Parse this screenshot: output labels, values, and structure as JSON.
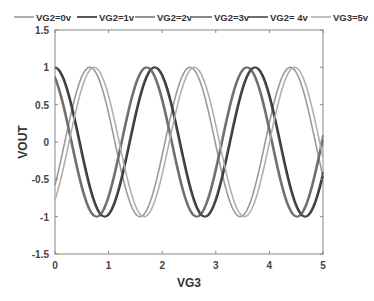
{
  "chart_data": {
    "type": "line",
    "title": "",
    "xlabel": "VG3",
    "ylabel": "VOUT",
    "xlim": [
      0,
      5
    ],
    "ylim": [
      -1.5,
      1.5
    ],
    "xticks": [
      0,
      1,
      2,
      3,
      4,
      5
    ],
    "xtick_labels": [
      "0",
      "1",
      "2",
      "3",
      "4",
      "5"
    ],
    "yticks": [
      -1.5,
      -1,
      -0.5,
      0,
      0.5,
      1,
      1.5
    ],
    "ytick_labels": [
      "-1.5",
      "-1",
      "-0.5",
      "0",
      "0.5",
      "1",
      "1.5"
    ],
    "grid": false,
    "legend_position": "top",
    "x": [
      0,
      0.25,
      0.5,
      0.75,
      1,
      1.25,
      1.5,
      1.75,
      2,
      2.25,
      2.5,
      2.75,
      3,
      3.25,
      3.5,
      3.75,
      4,
      4.25,
      4.5,
      4.75,
      5
    ],
    "series": [
      {
        "name": "VG2=0v",
        "color": "#9a9a9a",
        "period": 1.87,
        "phase": 0.65,
        "values": [
          0.45,
          0.83,
          1.0,
          0.9,
          0.57,
          0.1,
          -0.39,
          -0.79,
          -0.99,
          -0.94,
          -0.64,
          -0.2,
          0.3,
          0.73,
          0.97,
          0.97,
          0.7,
          0.26,
          -0.23,
          -0.68,
          -0.95
        ]
      },
      {
        "name": "VG2=1v",
        "color": "#2e2e2e",
        "period": 1.87,
        "phase": 0.0,
        "values": [
          1.0,
          0.67,
          -0.11,
          -0.81,
          -0.96,
          -0.44,
          0.36,
          0.94,
          0.85,
          0.17,
          -0.64,
          -1.0,
          -0.58,
          0.23,
          0.88,
          0.91,
          0.28,
          -0.54,
          -0.99,
          -0.69,
          0.11
        ]
      },
      {
        "name": "VG2=2v",
        "color": "#7a7a7a",
        "period": 1.87,
        "phase": -0.17,
        "values": [
          0.86,
          0.31,
          -0.47,
          -0.95,
          -0.83,
          -0.2,
          0.6,
          0.99,
          0.72,
          0.0,
          -0.72,
          -0.99,
          -0.6,
          0.2,
          0.83,
          0.95,
          0.47,
          -0.31,
          -0.86,
          -0.9,
          -0.4
        ]
      },
      {
        "name": "VG2=3v",
        "color": "#6a6a6a",
        "period": 1.87,
        "phase": 1.72,
        "values": [
          -0.23,
          0.26,
          0.7,
          0.97,
          0.97,
          0.73,
          0.3,
          -0.2,
          -0.64,
          -0.94,
          -0.99,
          -0.79,
          -0.39,
          0.1,
          0.57,
          0.9,
          1.0,
          0.83,
          0.45,
          -0.06,
          -0.53
        ]
      },
      {
        "name": "VG2= 4v",
        "color": "#4a4a4a",
        "period": 1.87,
        "phase": 1.85,
        "values": [
          -0.67,
          -0.2,
          0.38,
          0.84,
          1.0,
          0.79,
          0.34,
          -0.24,
          -0.73,
          -0.99,
          -0.88,
          -0.47,
          0.12,
          0.65,
          0.96,
          0.93,
          0.58,
          0.01,
          -0.55,
          -0.92,
          -0.97
        ]
      },
      {
        "name": "VG3=5v",
        "color": "#b0b0b0",
        "period": 1.87,
        "phase": 2.6,
        "values": [
          -0.97,
          -0.95,
          -0.66,
          -0.19,
          0.33,
          0.76,
          0.99,
          0.95,
          0.64,
          0.16,
          -0.36,
          -0.78,
          -0.99,
          -0.93,
          -0.6,
          -0.11,
          0.4,
          0.81,
          1.0,
          0.89,
          0.52
        ]
      }
    ]
  }
}
